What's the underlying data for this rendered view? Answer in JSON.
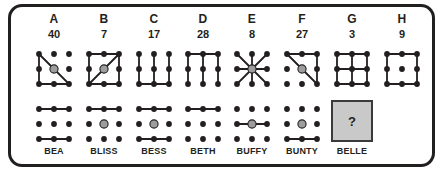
{
  "puzzle": {
    "type": "dot-grid-logic-puzzle",
    "grid_size": 3,
    "colors": {
      "ink": "#231f20",
      "dot": "#231f20",
      "highlight_dot": "#9d9d9d",
      "question_box_fill": "#c9c9c9",
      "card_border": "#221f1f",
      "card_background": "#ffffff"
    },
    "columns": [
      {
        "letter": "A",
        "number": "40",
        "name": "BEA",
        "top": {
          "center_dot": "highlighted",
          "edges": [
            {
              "from": [
                0,
                0
              ],
              "to": [
                0,
                1
              ]
            },
            {
              "from": [
                0,
                1
              ],
              "to": [
                0,
                2
              ]
            },
            {
              "from": [
                0,
                2
              ],
              "to": [
                1,
                2
              ]
            },
            {
              "from": [
                1,
                2
              ],
              "to": [
                2,
                2
              ]
            },
            {
              "from": [
                0,
                0
              ],
              "to": [
                1,
                1
              ]
            },
            {
              "from": [
                1,
                1
              ],
              "to": [
                2,
                2
              ]
            }
          ]
        },
        "bottom": {
          "center_dot": "plain",
          "edges": [
            {
              "from": [
                0,
                0
              ],
              "to": [
                1,
                0
              ]
            },
            {
              "from": [
                1,
                0
              ],
              "to": [
                2,
                0
              ]
            },
            {
              "from": [
                0,
                2
              ],
              "to": [
                1,
                2
              ]
            },
            {
              "from": [
                1,
                2
              ],
              "to": [
                2,
                2
              ]
            }
          ]
        }
      },
      {
        "letter": "B",
        "number": "7",
        "name": "BLISS",
        "top": {
          "center_dot": "highlighted",
          "edges": [
            {
              "from": [
                0,
                0
              ],
              "to": [
                1,
                0
              ]
            },
            {
              "from": [
                1,
                0
              ],
              "to": [
                2,
                0
              ]
            },
            {
              "from": [
                2,
                0
              ],
              "to": [
                2,
                1
              ]
            },
            {
              "from": [
                2,
                1
              ],
              "to": [
                2,
                2
              ]
            },
            {
              "from": [
                2,
                2
              ],
              "to": [
                1,
                2
              ]
            },
            {
              "from": [
                1,
                2
              ],
              "to": [
                0,
                2
              ]
            },
            {
              "from": [
                0,
                2
              ],
              "to": [
                0,
                1
              ]
            },
            {
              "from": [
                0,
                1
              ],
              "to": [
                0,
                0
              ]
            },
            {
              "from": [
                0,
                2
              ],
              "to": [
                1,
                1
              ]
            },
            {
              "from": [
                1,
                1
              ],
              "to": [
                2,
                0
              ]
            }
          ]
        },
        "bottom": {
          "center_dot": "highlighted",
          "edges": [
            {
              "from": [
                0,
                0
              ],
              "to": [
                1,
                0
              ]
            },
            {
              "from": [
                1,
                0
              ],
              "to": [
                2,
                0
              ]
            }
          ]
        }
      },
      {
        "letter": "C",
        "number": "17",
        "name": "BESS",
        "top": {
          "center_dot": "plain",
          "edges": [
            {
              "from": [
                0,
                0
              ],
              "to": [
                0,
                1
              ]
            },
            {
              "from": [
                0,
                1
              ],
              "to": [
                0,
                2
              ]
            },
            {
              "from": [
                1,
                0
              ],
              "to": [
                1,
                1
              ]
            },
            {
              "from": [
                1,
                1
              ],
              "to": [
                1,
                2
              ]
            },
            {
              "from": [
                2,
                0
              ],
              "to": [
                2,
                1
              ]
            },
            {
              "from": [
                2,
                1
              ],
              "to": [
                2,
                2
              ]
            },
            {
              "from": [
                0,
                2
              ],
              "to": [
                1,
                2
              ]
            },
            {
              "from": [
                1,
                2
              ],
              "to": [
                2,
                2
              ]
            }
          ]
        },
        "bottom": {
          "center_dot": "highlighted",
          "edges": [
            {
              "from": [
                0,
                0
              ],
              "to": [
                1,
                0
              ]
            },
            {
              "from": [
                1,
                0
              ],
              "to": [
                2,
                0
              ]
            },
            {
              "from": [
                0,
                2
              ],
              "to": [
                1,
                2
              ]
            },
            {
              "from": [
                1,
                2
              ],
              "to": [
                2,
                2
              ]
            }
          ]
        }
      },
      {
        "letter": "D",
        "number": "28",
        "name": "BETH",
        "top": {
          "center_dot": "plain",
          "edges": [
            {
              "from": [
                0,
                0
              ],
              "to": [
                0,
                1
              ]
            },
            {
              "from": [
                0,
                1
              ],
              "to": [
                0,
                2
              ]
            },
            {
              "from": [
                1,
                0
              ],
              "to": [
                1,
                1
              ]
            },
            {
              "from": [
                1,
                1
              ],
              "to": [
                1,
                2
              ]
            },
            {
              "from": [
                2,
                0
              ],
              "to": [
                2,
                1
              ]
            },
            {
              "from": [
                2,
                1
              ],
              "to": [
                2,
                2
              ]
            },
            {
              "from": [
                0,
                0
              ],
              "to": [
                1,
                0
              ]
            },
            {
              "from": [
                1,
                0
              ],
              "to": [
                2,
                0
              ]
            }
          ]
        },
        "bottom": {
          "center_dot": "plain",
          "edges": [
            {
              "from": [
                0,
                0
              ],
              "to": [
                1,
                0
              ]
            },
            {
              "from": [
                1,
                0
              ],
              "to": [
                2,
                0
              ]
            }
          ]
        }
      },
      {
        "letter": "E",
        "number": "8",
        "name": "BUFFY",
        "top": {
          "center_dot": "highlighted",
          "edges": [
            {
              "from": [
                1,
                1
              ],
              "to": [
                0,
                0
              ]
            },
            {
              "from": [
                1,
                1
              ],
              "to": [
                1,
                0
              ]
            },
            {
              "from": [
                1,
                1
              ],
              "to": [
                2,
                0
              ]
            },
            {
              "from": [
                1,
                1
              ],
              "to": [
                0,
                1
              ]
            },
            {
              "from": [
                1,
                1
              ],
              "to": [
                2,
                1
              ]
            },
            {
              "from": [
                1,
                1
              ],
              "to": [
                0,
                2
              ]
            },
            {
              "from": [
                1,
                1
              ],
              "to": [
                1,
                2
              ]
            },
            {
              "from": [
                1,
                1
              ],
              "to": [
                2,
                2
              ]
            }
          ]
        },
        "bottom": {
          "center_dot": "highlighted",
          "edges": [
            {
              "from": [
                0,
                1
              ],
              "to": [
                1,
                1
              ]
            },
            {
              "from": [
                1,
                1
              ],
              "to": [
                2,
                1
              ]
            }
          ]
        }
      },
      {
        "letter": "F",
        "number": "27",
        "name": "BUNTY",
        "top": {
          "center_dot": "highlighted",
          "edges": [
            {
              "from": [
                0,
                0
              ],
              "to": [
                1,
                0
              ]
            },
            {
              "from": [
                1,
                0
              ],
              "to": [
                2,
                0
              ]
            },
            {
              "from": [
                2,
                0
              ],
              "to": [
                2,
                1
              ]
            },
            {
              "from": [
                2,
                1
              ],
              "to": [
                2,
                2
              ]
            },
            {
              "from": [
                0,
                0
              ],
              "to": [
                1,
                1
              ]
            },
            {
              "from": [
                1,
                1
              ],
              "to": [
                2,
                2
              ]
            }
          ]
        },
        "bottom": {
          "center_dot": "highlighted",
          "edges": [
            {
              "from": [
                0,
                2
              ],
              "to": [
                1,
                2
              ]
            },
            {
              "from": [
                1,
                2
              ],
              "to": [
                2,
                2
              ]
            }
          ]
        }
      },
      {
        "letter": "G",
        "number": "3",
        "name": "BELLE",
        "top": {
          "center_dot": "plain",
          "edges": [
            {
              "from": [
                0,
                0
              ],
              "to": [
                1,
                0
              ]
            },
            {
              "from": [
                1,
                0
              ],
              "to": [
                2,
                0
              ]
            },
            {
              "from": [
                0,
                1
              ],
              "to": [
                1,
                1
              ]
            },
            {
              "from": [
                1,
                1
              ],
              "to": [
                2,
                1
              ]
            },
            {
              "from": [
                0,
                2
              ],
              "to": [
                1,
                2
              ]
            },
            {
              "from": [
                1,
                2
              ],
              "to": [
                2,
                2
              ]
            },
            {
              "from": [
                0,
                0
              ],
              "to": [
                0,
                1
              ]
            },
            {
              "from": [
                0,
                1
              ],
              "to": [
                0,
                2
              ]
            },
            {
              "from": [
                1,
                0
              ],
              "to": [
                1,
                1
              ]
            },
            {
              "from": [
                1,
                1
              ],
              "to": [
                1,
                2
              ]
            },
            {
              "from": [
                2,
                0
              ],
              "to": [
                2,
                1
              ]
            },
            {
              "from": [
                2,
                1
              ],
              "to": [
                2,
                2
              ]
            }
          ]
        },
        "bottom": {
          "is_question_box": true,
          "question_mark": "?"
        }
      },
      {
        "letter": "H",
        "number": "9",
        "name": "",
        "top": {
          "center_dot": "plain",
          "edges": [
            {
              "from": [
                0,
                0
              ],
              "to": [
                1,
                0
              ]
            },
            {
              "from": [
                1,
                0
              ],
              "to": [
                2,
                0
              ]
            },
            {
              "from": [
                2,
                0
              ],
              "to": [
                2,
                1
              ]
            },
            {
              "from": [
                2,
                1
              ],
              "to": [
                2,
                2
              ]
            },
            {
              "from": [
                2,
                2
              ],
              "to": [
                1,
                2
              ]
            },
            {
              "from": [
                1,
                2
              ],
              "to": [
                0,
                2
              ]
            },
            {
              "from": [
                0,
                2
              ],
              "to": [
                0,
                1
              ]
            },
            {
              "from": [
                0,
                1
              ],
              "to": [
                0,
                0
              ]
            }
          ]
        },
        "bottom": null
      }
    ]
  }
}
